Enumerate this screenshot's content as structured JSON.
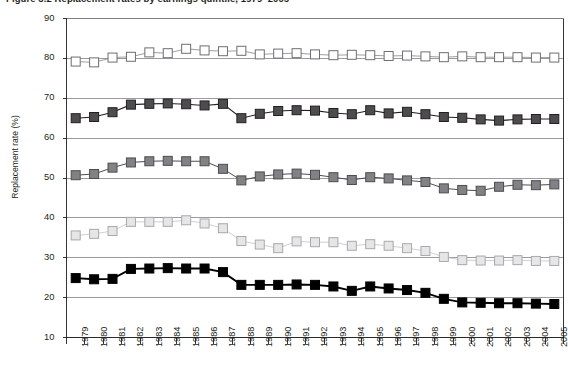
{
  "chart_data": {
    "type": "line",
    "title": "Figure 3.2  Replacement rates by earnings quintile, 1979–2005",
    "xlabel": "",
    "ylabel": "Replacement rate (%)",
    "ylim": [
      10,
      90
    ],
    "ytick_step": 10,
    "yticks": [
      90,
      80,
      70,
      60,
      50,
      40,
      30,
      20,
      10
    ],
    "grid": "horizontal",
    "legend_position": "none",
    "x": [
      "1979",
      "1980",
      "1981",
      "1982",
      "1983",
      "1984",
      "1985",
      "1986",
      "1987",
      "1988",
      "1989",
      "1990",
      "1991",
      "1992",
      "1993",
      "1994",
      "1995",
      "1996",
      "1997",
      "1998",
      "1999",
      "2000",
      "2001",
      "2002",
      "2003",
      "2004",
      "2005"
    ],
    "categories": [
      "1979",
      "1980",
      "1981",
      "1982",
      "1983",
      "1984",
      "1985",
      "1986",
      "1987",
      "1988",
      "1989",
      "1990",
      "1991",
      "1992",
      "1993",
      "1994",
      "1995",
      "1996",
      "1997",
      "1998",
      "1999",
      "2000",
      "2001",
      "2002",
      "2003",
      "2004",
      "2005"
    ],
    "series": [
      {
        "name": "Series 1 (open square, white)",
        "marker": "open-square",
        "marker_fill": "#ffffff",
        "marker_stroke": "#6d6e71",
        "line_color": "#8c8c8c",
        "values": [
          79.2,
          79.0,
          80.2,
          80.4,
          81.5,
          81.3,
          82.4,
          82.0,
          81.8,
          81.9,
          81.0,
          81.2,
          81.3,
          81.0,
          80.8,
          80.9,
          80.8,
          80.6,
          80.7,
          80.5,
          80.3,
          80.5,
          80.3,
          80.3,
          80.3,
          80.2,
          80.2
        ]
      },
      {
        "name": "Series 2 (filled square, dark grey)",
        "marker": "filled-square",
        "marker_fill": "#4d4d4f",
        "marker_stroke": "#231f20",
        "line_color": "#231f20",
        "values": [
          65.0,
          65.3,
          66.5,
          68.4,
          68.6,
          68.7,
          68.5,
          68.2,
          68.6,
          65.0,
          66.1,
          66.8,
          67.0,
          66.9,
          66.3,
          66.0,
          67.0,
          66.2,
          66.6,
          66.0,
          65.3,
          65.1,
          64.7,
          64.4,
          64.7,
          64.8,
          64.8
        ]
      },
      {
        "name": "Series 3 (filled square, medium grey)",
        "marker": "filled-square",
        "marker_fill": "#808285",
        "marker_stroke": "#4d4d4f",
        "line_color": "#4d4d4f",
        "values": [
          50.7,
          51.0,
          52.6,
          53.9,
          54.2,
          54.3,
          54.2,
          54.2,
          52.3,
          49.4,
          50.4,
          50.9,
          51.1,
          50.8,
          50.2,
          49.5,
          50.2,
          49.9,
          49.4,
          49.0,
          47.4,
          47.0,
          46.8,
          47.8,
          48.3,
          48.2,
          48.4
        ]
      },
      {
        "name": "Series 4 (open square, light grey)",
        "marker": "open-square",
        "marker_fill": "#e6e6e6",
        "marker_stroke": "#a7a9ac",
        "line_color": "#c6c6c6",
        "values": [
          35.6,
          36.0,
          36.7,
          39.0,
          39.0,
          39.0,
          39.4,
          38.6,
          37.4,
          34.2,
          33.3,
          32.4,
          34.1,
          33.9,
          33.9,
          33.0,
          33.4,
          33.0,
          32.4,
          31.7,
          30.2,
          29.4,
          29.3,
          29.3,
          29.4,
          29.2,
          29.2
        ]
      },
      {
        "name": "Series 5 (filled square, black)",
        "marker": "filled-square",
        "marker_fill": "#000000",
        "marker_stroke": "#000000",
        "line_color": "#000000",
        "values": [
          24.9,
          24.6,
          24.7,
          27.2,
          27.3,
          27.4,
          27.3,
          27.3,
          26.4,
          23.2,
          23.2,
          23.2,
          23.3,
          23.2,
          22.8,
          21.7,
          22.8,
          22.3,
          21.9,
          21.2,
          19.7,
          18.8,
          18.7,
          18.6,
          18.6,
          18.5,
          18.4
        ]
      }
    ]
  },
  "colors": {
    "axis": "#231f20",
    "gridline": "#808285",
    "text": "#231f20",
    "background": "#ffffff"
  }
}
